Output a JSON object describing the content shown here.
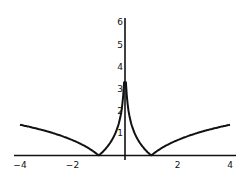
{
  "chart_data": {
    "type": "line",
    "title": "",
    "xlabel": "",
    "ylabel": "",
    "function": "|ln|x||",
    "xlim": [
      -4,
      4
    ],
    "ylim": [
      0,
      6.2
    ],
    "grid": false,
    "legend": null,
    "x_ticks": [
      "-4",
      "-2",
      "2",
      "4"
    ],
    "y_ticks": [
      "1",
      "2",
      "3",
      "4",
      "5",
      "6"
    ],
    "series": [
      {
        "name": "y = |ln|x||",
        "x": [
          -4,
          -3,
          -2,
          -1.5,
          -1,
          -0.75,
          -0.5,
          -0.25,
          -0.1,
          -0.04,
          0.04,
          0.1,
          0.25,
          0.5,
          0.75,
          1,
          1.5,
          2,
          3,
          4
        ],
        "y": [
          1.39,
          1.1,
          0.69,
          0.41,
          0.0,
          0.29,
          0.69,
          1.39,
          2.3,
          3.2,
          3.2,
          2.3,
          1.39,
          0.69,
          0.29,
          0.0,
          0.41,
          0.69,
          1.1,
          1.39
        ]
      }
    ]
  }
}
